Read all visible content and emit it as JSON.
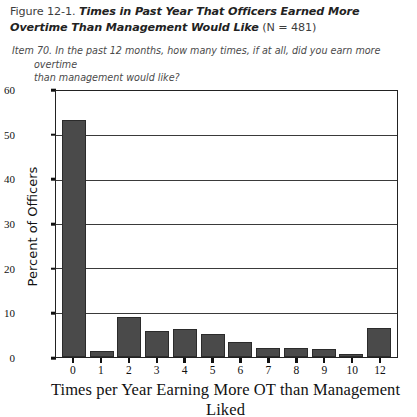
{
  "figure": {
    "number_prefix": "Figure 12-1.",
    "title_emphasis": "Times in Past Year That Officers Earned More Overtime Than Management Would Like",
    "sample_size": "(N = 481)",
    "item_line1": "Item 70. In the past 12 months, how many times, if at all, did you earn more overtime",
    "item_line2": "than management would like?"
  },
  "chart_data": {
    "type": "bar",
    "title": "Times in Past Year That Officers Earned More Overtime Than Management Would Like",
    "xlabel": "Times per Year Earning More OT than Management Liked",
    "ylabel": "Percent of Officers",
    "categories": [
      "0",
      "1",
      "2",
      "3",
      "4",
      "5",
      "6",
      "7",
      "8",
      "9",
      "10",
      "12"
    ],
    "values": [
      53,
      1.3,
      9,
      5.8,
      6.2,
      5.1,
      3.3,
      2.1,
      2.0,
      1.8,
      0.6,
      6.6
    ],
    "ylim": [
      0,
      60
    ],
    "yticks": [
      "0",
      "10",
      "20",
      "30",
      "40",
      "50",
      "60"
    ],
    "ytick_values": [
      0,
      10,
      20,
      30,
      40,
      50,
      60
    ],
    "grid": "horizontal",
    "legend": "none",
    "bar_color": "#4a4a4a",
    "bar_edge_color": "#2b2b2b",
    "axis_color": "#222222",
    "n": 481
  }
}
